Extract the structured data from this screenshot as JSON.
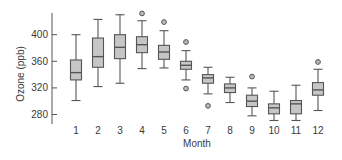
{
  "chart_data": {
    "type": "boxplot",
    "title": "",
    "xlabel": "Month",
    "ylabel": "Ozone (ppb)",
    "ylim": [
      270,
      435
    ],
    "yticks": [
      280,
      320,
      360,
      400
    ],
    "categories": [
      "1",
      "2",
      "3",
      "4",
      "5",
      "6",
      "7",
      "8",
      "9",
      "10",
      "11",
      "12"
    ],
    "grid": false,
    "legend": null,
    "boxes": [
      {
        "month": "1",
        "whisker_low": 301,
        "q1": 332,
        "median": 343,
        "q3": 362,
        "whisker_high": 400,
        "outliers": []
      },
      {
        "month": "2",
        "whisker_low": 322,
        "q1": 351,
        "median": 367,
        "q3": 395,
        "whisker_high": 423,
        "outliers": []
      },
      {
        "month": "3",
        "whisker_low": 327,
        "q1": 364,
        "median": 381,
        "q3": 400,
        "whisker_high": 430,
        "outliers": []
      },
      {
        "month": "4",
        "whisker_low": 349,
        "q1": 373,
        "median": 385,
        "q3": 397,
        "whisker_high": 421,
        "outliers": [
          432
        ]
      },
      {
        "month": "5",
        "whisker_low": 350,
        "q1": 363,
        "median": 374,
        "q3": 384,
        "whisker_high": 406,
        "outliers": [
          419
        ]
      },
      {
        "month": "6",
        "whisker_low": 332,
        "q1": 348,
        "median": 354,
        "q3": 360,
        "whisker_high": 376,
        "outliers": [
          389,
          319
        ]
      },
      {
        "month": "7",
        "whisker_low": 311,
        "q1": 327,
        "median": 335,
        "q3": 340,
        "whisker_high": 351,
        "outliers": [
          293
        ]
      },
      {
        "month": "8",
        "whisker_low": 298,
        "q1": 313,
        "median": 320,
        "q3": 326,
        "whisker_high": 336,
        "outliers": []
      },
      {
        "month": "9",
        "whisker_low": 278,
        "q1": 292,
        "median": 300,
        "q3": 309,
        "whisker_high": 320,
        "outliers": [
          337
        ]
      },
      {
        "month": "10",
        "whisker_low": 271,
        "q1": 281,
        "median": 290,
        "q3": 296,
        "whisker_high": 315,
        "outliers": []
      },
      {
        "month": "11",
        "whisker_low": 271,
        "q1": 281,
        "median": 296,
        "q3": 301,
        "whisker_high": 324,
        "outliers": []
      },
      {
        "month": "12",
        "whisker_low": 286,
        "q1": 309,
        "median": 317,
        "q3": 328,
        "whisker_high": 348,
        "outliers": [
          359
        ]
      }
    ]
  },
  "colors": {
    "box_fill": "#c6c6c6",
    "stroke": "#555555",
    "outlier_fill": "#b8b8b8",
    "text": "#3a3a3a"
  }
}
